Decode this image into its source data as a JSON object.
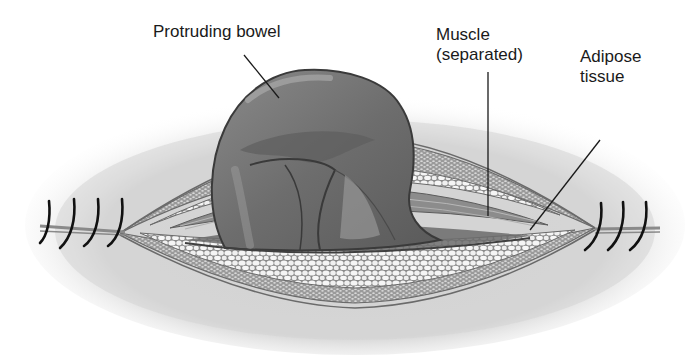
{
  "diagram": {
    "labels": {
      "bowel": {
        "text": "Protruding bowel"
      },
      "muscle": {
        "line1": "Muscle",
        "line2": "(separated)"
      },
      "adipose": {
        "line1": "Adipose",
        "line2": "tissue"
      }
    },
    "sutures": {
      "left_count": 4,
      "right_count": 3
    },
    "colors": {
      "background": "#ffffff",
      "skin_shadow": "#d6d6d6",
      "bowel_dark": "#5a5a5a",
      "bowel_mid": "#777777",
      "bowel_light": "#9a9a9a",
      "fat_cells": "#f4f4f4",
      "tissue_lines": "#6e6e6e",
      "suture": "#111111",
      "text": "#1a1a1a"
    }
  }
}
